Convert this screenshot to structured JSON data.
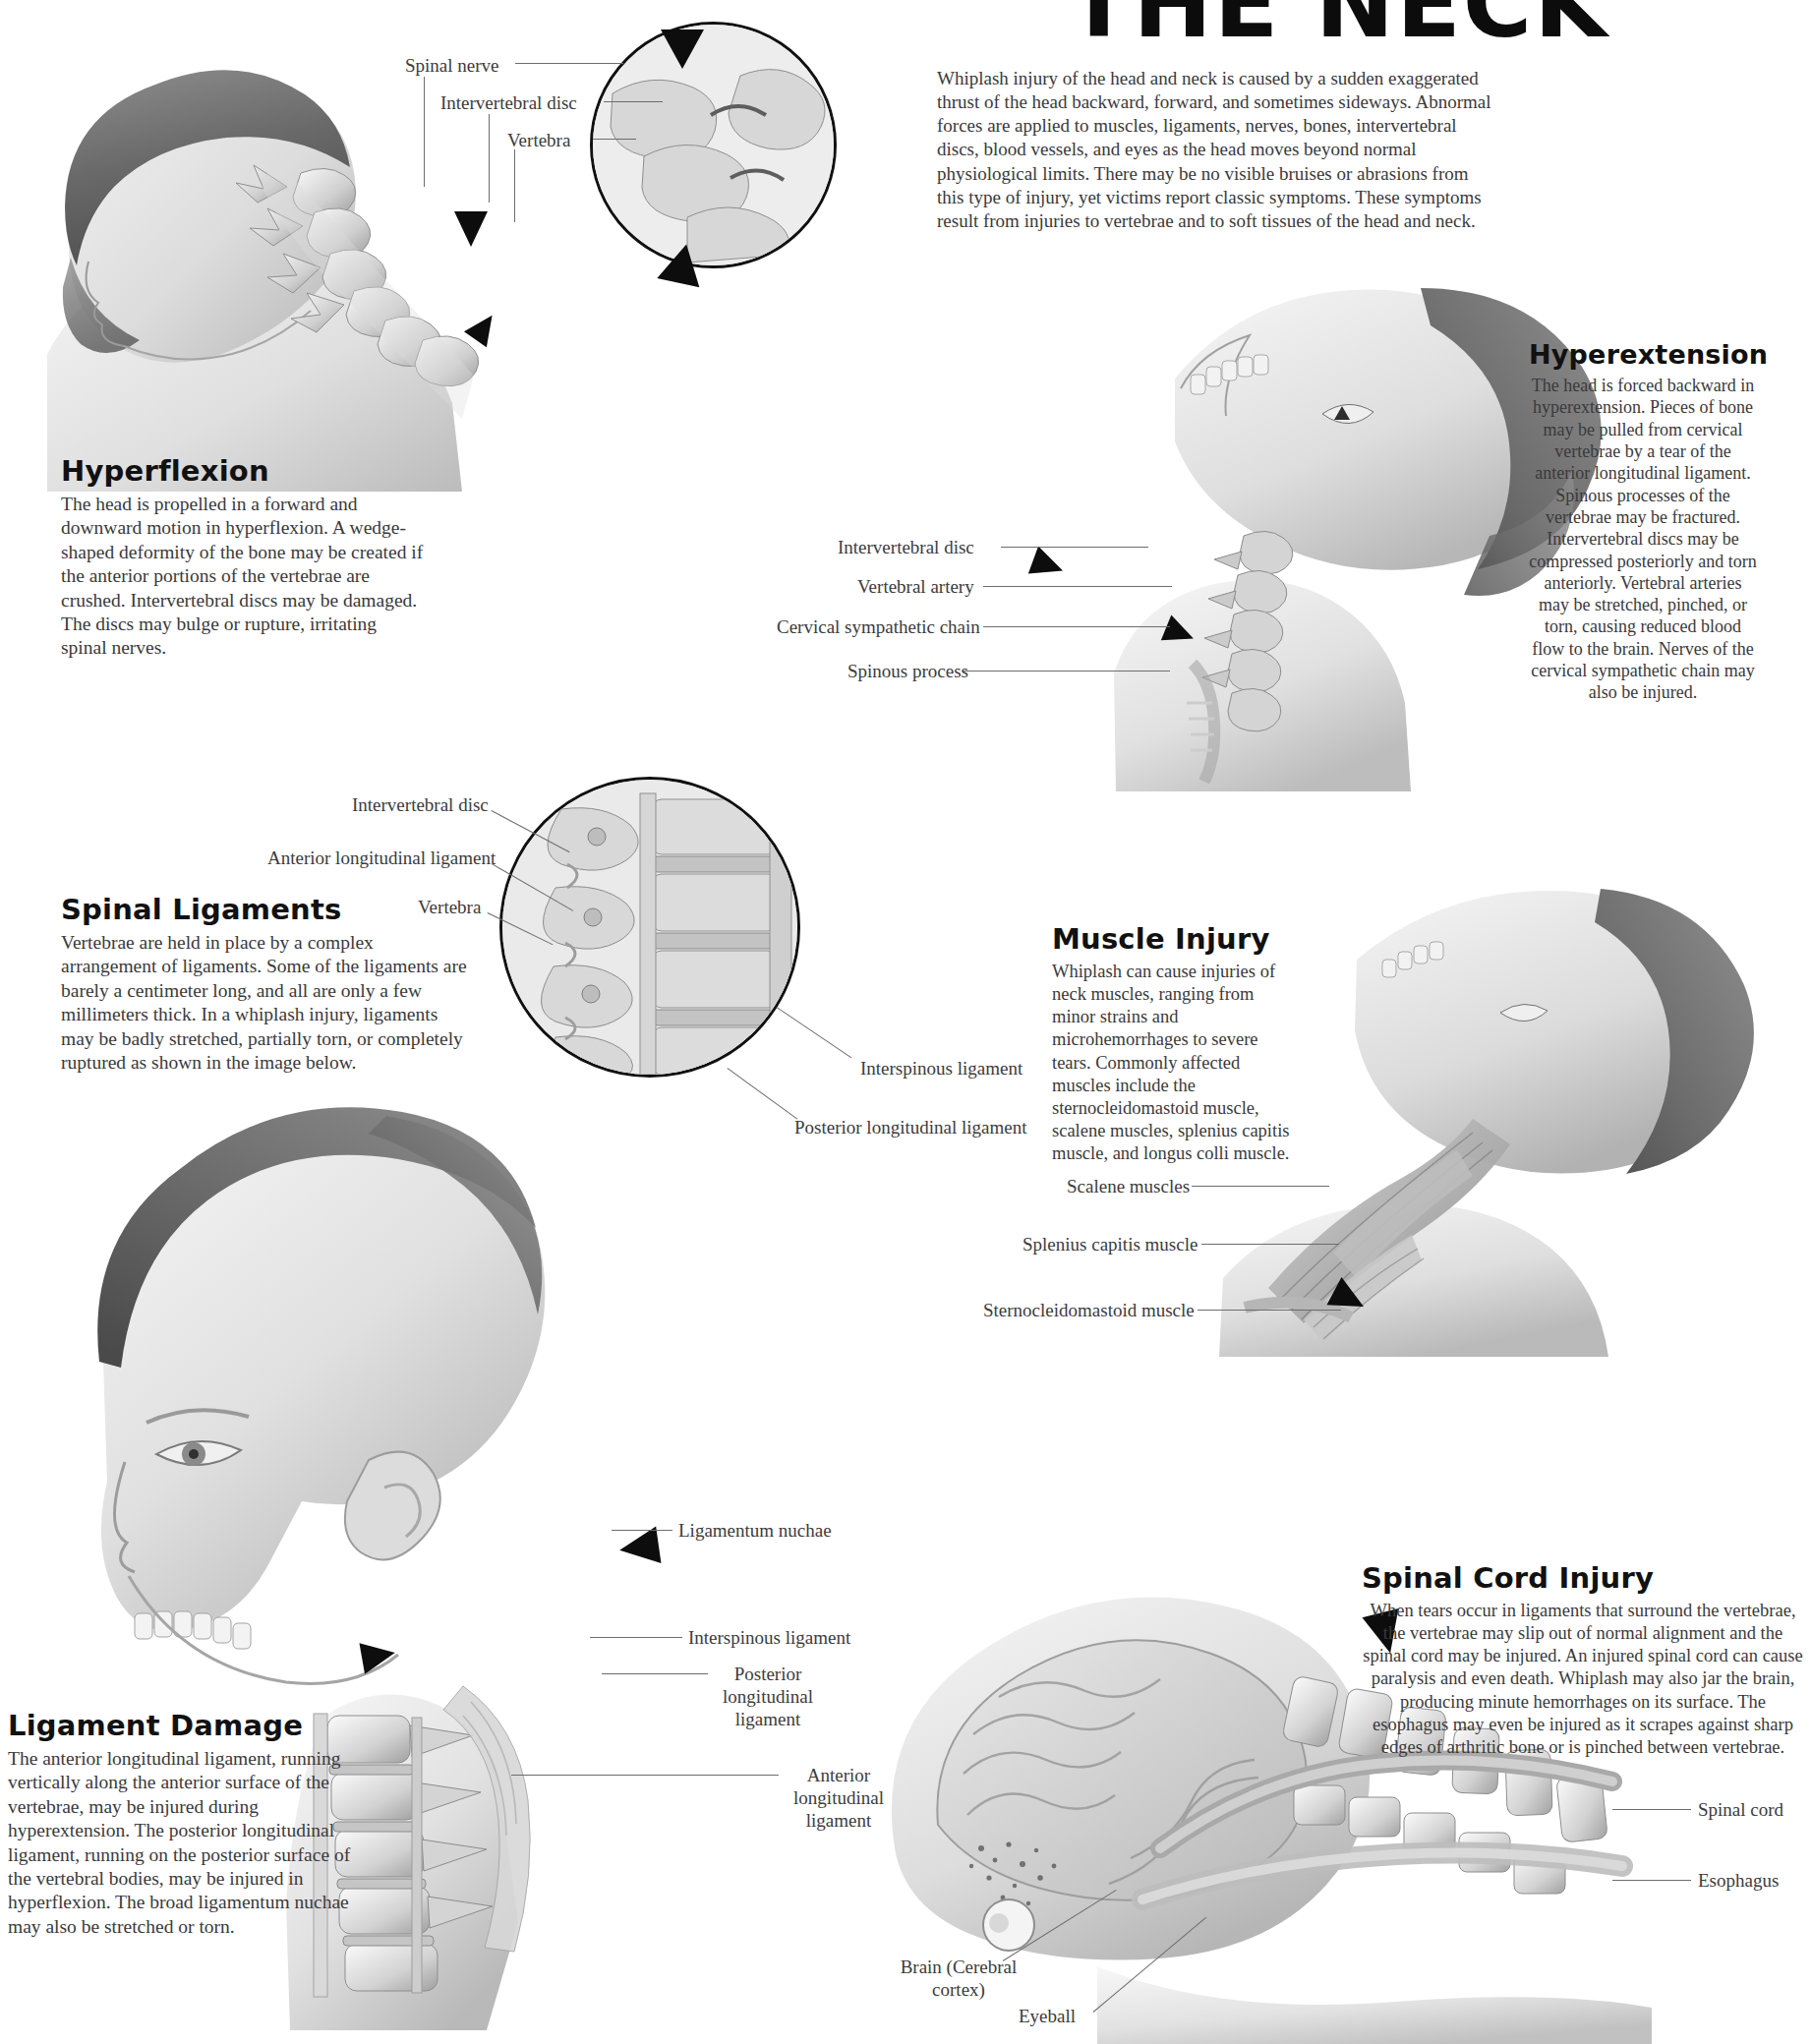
{
  "poster": {
    "title_fragment": "THE NECK",
    "intro": "Whiplash injury of the head and neck is caused by a sudden exaggerated thrust of the head backward, forward, and sometimes sideways. Abnormal forces are applied to muscles, ligaments, nerves, bones, intervertebral discs, blood vessels, and eyes as the head moves beyond normal physiological limits. There may be no visible bruises or abrasions from this type of injury, yet victims report classic symptoms. These symptoms result from injuries to vertebrae and to soft tissues of the head and neck."
  },
  "sections": {
    "hyperflexion": {
      "title": "Hyperflexion",
      "body": "The head is propelled in a forward and downward motion in hyperflexion. A wedge-shaped deformity of the bone may be created if the anterior portions of the vertebrae are crushed. Intervertebral discs may be damaged. The discs may bulge or rupture, irritating spinal nerves."
    },
    "hyperextension": {
      "title": "Hyperextension",
      "body": "The head is forced backward in hyperextension. Pieces of bone may be pulled from cervical vertebrae by a tear of the anterior longitudinal ligament. Spinous processes of the vertebrae may be fractured. Intervertebral discs may be compressed posteriorly and torn anteriorly. Vertebral arteries may be stretched, pinched, or torn, causing reduced blood flow to the brain. Nerves of the cervical sympathetic chain may also be injured."
    },
    "spinal_ligaments": {
      "title": "Spinal Ligaments",
      "body": "Vertebrae are held in place by a complex arrangement of ligaments. Some of the ligaments are barely a centimeter long, and all are only a few millimeters thick. In a whiplash injury, ligaments may be badly stretched, partially torn, or completely ruptured as shown in the image below."
    },
    "muscle_injury": {
      "title": "Muscle Injury",
      "body": "Whiplash can cause injuries of neck muscles, ranging from minor strains and microhemorrhages to severe tears. Commonly affected muscles include the sternocleidomastoid muscle, scalene muscles, splenius capitis muscle, and longus colli muscle."
    },
    "ligament_damage": {
      "title": "Ligament Damage",
      "body": "The anterior longitudinal ligament, running vertically along the anterior surface of the vertebrae, may be injured during hyperextension. The posterior longitudinal ligament, running on the posterior surface of the vertebral bodies, may be injured in hyperflexion. The broad ligamentum nuchae may also be stretched or torn."
    },
    "spinal_cord_injury": {
      "title": "Spinal Cord Injury",
      "body": "When tears occur in ligaments that surround the vertebrae, the vertebrae may slip out of normal alignment and the spinal cord may be injured. An injured spinal cord can cause paralysis and even death. Whiplash may also jar the brain, producing minute hemorrhages on its surface. The esophagus may even be injured as it scrapes against sharp edges of arthritic bone or is pinched between vertebrae."
    }
  },
  "callouts": {
    "hyperflexion": [
      {
        "label": "Spinal nerve"
      },
      {
        "label": "Intervertebral disc"
      },
      {
        "label": "Vertebra"
      }
    ],
    "hyperextension": [
      {
        "label": "Intervertebral disc"
      },
      {
        "label": "Vertebral artery"
      },
      {
        "label": "Cervical sympathetic chain"
      },
      {
        "label": "Spinous process"
      }
    ],
    "spinal_ligaments_inset": [
      {
        "label": "Intervertebral disc"
      },
      {
        "label": "Anterior longitudinal ligament"
      },
      {
        "label": "Vertebra"
      },
      {
        "label": "Interspinous ligament"
      },
      {
        "label": "Posterior longitudinal ligament"
      }
    ],
    "muscle_injury": [
      {
        "label": "Scalene muscles"
      },
      {
        "label": "Splenius capitis muscle"
      },
      {
        "label": "Sternocleidomastoid muscle"
      }
    ],
    "ligament_damage": [
      {
        "label": "Ligamentum nuchae"
      },
      {
        "label": "Interspinous ligament"
      },
      {
        "label": "Posterior longitudinal ligament"
      },
      {
        "label": "Anterior longitudinal ligament"
      }
    ],
    "spinal_cord_injury": [
      {
        "label": "Spinal cord"
      },
      {
        "label": "Esophagus"
      },
      {
        "label": "Brain (Cerebral cortex)"
      },
      {
        "label": "Eyeball"
      }
    ]
  },
  "colors": {
    "ink": "#2b2b2b",
    "heading": "#111111",
    "leader": "#6d6d6d",
    "arrow": "#0d0d0d",
    "art_light": "#e6e6e6",
    "art_mid": "#bdbdbd",
    "art_dark": "#8a8a8a"
  }
}
